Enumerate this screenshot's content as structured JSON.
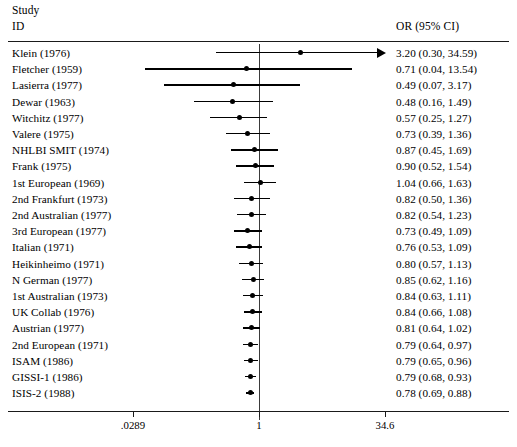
{
  "header": {
    "study_line1": "Study",
    "study_line2": "ID",
    "or_label": "OR (95% CI)"
  },
  "axis": {
    "left_tick_label": ".0289",
    "center_tick_label": "1",
    "right_tick_label": "34.6"
  },
  "chart_data": {
    "type": "forest",
    "title": "",
    "xlabel": "",
    "ylabel": "",
    "x_scale": "log",
    "xlim": [
      0.0289,
      34.6
    ],
    "xticks": [
      0.0289,
      1,
      34.6
    ],
    "xticklabels": [
      ".0289",
      "1",
      "34.6"
    ],
    "null_value": 1,
    "grid": false,
    "legend": "none",
    "effect_measure": "OR",
    "ci_level": "95%",
    "columns": [
      "Study ID",
      "OR (95% CI)"
    ],
    "studies": [
      {
        "label": "Klein (1976)",
        "or": 3.2,
        "lcl": 0.3,
        "ucl": 34.59,
        "text": "3.20 (0.30, 34.59)",
        "truncated_right": true
      },
      {
        "label": "Fletcher (1959)",
        "or": 0.71,
        "lcl": 0.04,
        "ucl": 13.54,
        "text": "0.71 (0.04, 13.54)",
        "truncated_right": false
      },
      {
        "label": "Lasierra (1977)",
        "or": 0.49,
        "lcl": 0.07,
        "ucl": 3.17,
        "text": "0.49 (0.07, 3.17)",
        "truncated_right": false
      },
      {
        "label": "Dewar (1963)",
        "or": 0.48,
        "lcl": 0.16,
        "ucl": 1.49,
        "text": "0.48 (0.16, 1.49)",
        "truncated_right": false
      },
      {
        "label": "Witchitz (1977)",
        "or": 0.57,
        "lcl": 0.25,
        "ucl": 1.27,
        "text": "0.57 (0.25, 1.27)",
        "truncated_right": false
      },
      {
        "label": "Valere (1975)",
        "or": 0.73,
        "lcl": 0.39,
        "ucl": 1.36,
        "text": "0.73 (0.39, 1.36)",
        "truncated_right": false
      },
      {
        "label": "NHLBI SMIT (1974)",
        "or": 0.87,
        "lcl": 0.45,
        "ucl": 1.69,
        "text": "0.87 (0.45, 1.69)",
        "truncated_right": false
      },
      {
        "label": "Frank (1975)",
        "or": 0.9,
        "lcl": 0.52,
        "ucl": 1.54,
        "text": "0.90 (0.52, 1.54)",
        "truncated_right": false
      },
      {
        "label": "1st European (1969)",
        "or": 1.04,
        "lcl": 0.66,
        "ucl": 1.63,
        "text": "1.04 (0.66, 1.63)",
        "truncated_right": false
      },
      {
        "label": "2nd Frankfurt (1973)",
        "or": 0.82,
        "lcl": 0.5,
        "ucl": 1.36,
        "text": "0.82 (0.50, 1.36)",
        "truncated_right": false
      },
      {
        "label": "2nd Australian (1977)",
        "or": 0.82,
        "lcl": 0.54,
        "ucl": 1.23,
        "text": "0.82 (0.54, 1.23)",
        "truncated_right": false
      },
      {
        "label": "3rd European (1977)",
        "or": 0.73,
        "lcl": 0.49,
        "ucl": 1.09,
        "text": "0.73 (0.49, 1.09)",
        "truncated_right": false
      },
      {
        "label": "Italian (1971)",
        "or": 0.76,
        "lcl": 0.53,
        "ucl": 1.09,
        "text": "0.76 (0.53, 1.09)",
        "truncated_right": false
      },
      {
        "label": "Heikinheimo (1971)",
        "or": 0.8,
        "lcl": 0.57,
        "ucl": 1.13,
        "text": "0.80 (0.57, 1.13)",
        "truncated_right": false
      },
      {
        "label": "N German (1977)",
        "or": 0.85,
        "lcl": 0.62,
        "ucl": 1.16,
        "text": "0.85 (0.62, 1.16)",
        "truncated_right": false
      },
      {
        "label": "1st Australian (1973)",
        "or": 0.84,
        "lcl": 0.63,
        "ucl": 1.11,
        "text": "0.84 (0.63, 1.11)",
        "truncated_right": false
      },
      {
        "label": "UK Collab (1976)",
        "or": 0.84,
        "lcl": 0.66,
        "ucl": 1.08,
        "text": "0.84 (0.66, 1.08)",
        "truncated_right": false
      },
      {
        "label": "Austrian (1977)",
        "or": 0.81,
        "lcl": 0.64,
        "ucl": 1.02,
        "text": "0.81 (0.64, 1.02)",
        "truncated_right": false
      },
      {
        "label": "2nd European (1971)",
        "or": 0.79,
        "lcl": 0.64,
        "ucl": 0.97,
        "text": "0.79 (0.64, 0.97)",
        "truncated_right": false
      },
      {
        "label": "ISAM (1986)",
        "or": 0.79,
        "lcl": 0.65,
        "ucl": 0.96,
        "text": "0.79 (0.65, 0.96)",
        "truncated_right": false
      },
      {
        "label": "GISSI-1 (1986)",
        "or": 0.79,
        "lcl": 0.68,
        "ucl": 0.93,
        "text": "0.79 (0.68, 0.93)",
        "truncated_right": false
      },
      {
        "label": "ISIS-2 (1988)",
        "or": 0.78,
        "lcl": 0.69,
        "ucl": 0.88,
        "text": "0.78 (0.69, 0.88)",
        "truncated_right": false
      }
    ]
  },
  "colors": {
    "marker": "#000000",
    "line": "#000000",
    "rule": "#1a1a1a",
    "null_line": "#3a3a3a",
    "background": "#ffffff"
  }
}
